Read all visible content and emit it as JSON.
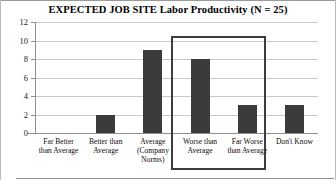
{
  "chart_data": {
    "type": "bar",
    "title": "EXPECTED JOB SITE Labor Productivity (N = 25)",
    "xlabel": "",
    "ylabel": "",
    "categories": [
      "Far Better than Average",
      "Better than Average",
      "Average (Company Norms)",
      "Worse than Average",
      "Far Worse than Average",
      "Don't Know"
    ],
    "category_lines": [
      [
        "Far Better",
        "than Average"
      ],
      [
        "Better than",
        "Average"
      ],
      [
        "Average",
        "(Company",
        "Norms)"
      ],
      [
        "Worse than",
        "Average"
      ],
      [
        "Far Worse",
        "than Average"
      ],
      [
        "Don't Know"
      ]
    ],
    "values": [
      0,
      2,
      9,
      8,
      3,
      3
    ],
    "ylim": [
      0,
      12
    ],
    "yticks": [
      0,
      2,
      4,
      6,
      8,
      10,
      12
    ],
    "ytick_labels": [
      "0",
      "2",
      "4",
      "6",
      "8",
      "10",
      "12"
    ],
    "grid": true,
    "legend": "none",
    "bar_color": "#3b3b3b",
    "gridline_color": "#c9c9c9",
    "axis_color": "#8f8f8f",
    "annotations": [
      {
        "name": "highlight-box",
        "shape": "rectangle",
        "covers": [
          "Worse than Average",
          "Far Worse than Average"
        ],
        "color": "#3d3d3d"
      }
    ]
  }
}
